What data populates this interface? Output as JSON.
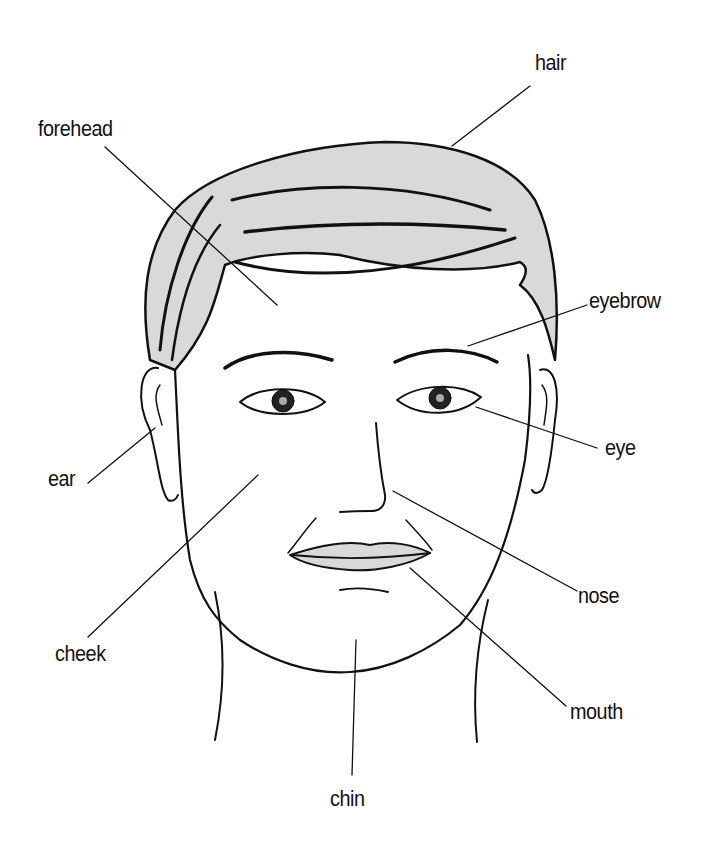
{
  "diagram": {
    "type": "labeled face diagram",
    "labels": [
      {
        "id": "hair",
        "text": "hair",
        "x": 535,
        "y": 52
      },
      {
        "id": "forehead",
        "text": "forehead",
        "x": 38,
        "y": 118
      },
      {
        "id": "eyebrow",
        "text": "eyebrow",
        "x": 589,
        "y": 290
      },
      {
        "id": "eye",
        "text": "eye",
        "x": 605,
        "y": 437
      },
      {
        "id": "ear",
        "text": "ear",
        "x": 48,
        "y": 468
      },
      {
        "id": "nose",
        "text": "nose",
        "x": 578,
        "y": 585
      },
      {
        "id": "cheek",
        "text": "cheek",
        "x": 55,
        "y": 643
      },
      {
        "id": "mouth",
        "text": "mouth",
        "x": 570,
        "y": 701
      },
      {
        "id": "chin",
        "text": "chin",
        "x": 330,
        "y": 788
      }
    ],
    "colors": {
      "ink": "#111111",
      "shade": "#d6d6d6",
      "background": "#ffffff"
    }
  }
}
